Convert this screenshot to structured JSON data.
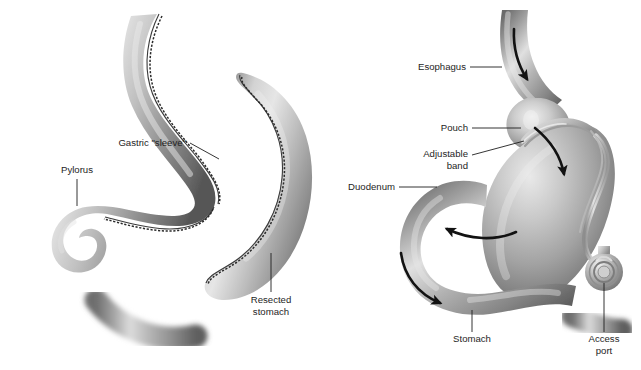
{
  "figure": {
    "background_color": "#ffffff",
    "label_color": "#1e1e1e",
    "tissue_light": "#e3e3e3",
    "tissue_mid": "#9d9d9d",
    "tissue_dark": "#5a5a5a",
    "staple_color": "#2b2b2b",
    "arrow_color": "#121212",
    "panels": [
      {
        "id": "left-panel",
        "name": "sleeve-gastrectomy-panel",
        "procedure": "Sleeve gastrectomy",
        "labels": [
          {
            "key": "gastric_sleeve",
            "text": "Gastric \"sleeve\"",
            "lines": [
              "Gastric \"sleeve\""
            ],
            "anchor": "end",
            "text_x": 186,
            "text_y": 143,
            "leader": "M190,143 L219,159"
          },
          {
            "key": "pylorus",
            "text": "Pylorus",
            "lines": [
              "Pylorus"
            ],
            "anchor": "middle",
            "text_x": 77,
            "text_y": 173,
            "leader": "M77,179 L77,206"
          },
          {
            "key": "resected_stomach",
            "text": "Resected stomach",
            "lines": [
              "Resected",
              "stomach"
            ],
            "anchor": "middle",
            "text_x": 271,
            "text_y": 303,
            "leader": "M271,253 L271,292"
          }
        ]
      },
      {
        "id": "right-panel",
        "name": "adjustable-gastric-band-panel",
        "procedure": "Adjustable gastric banding",
        "labels": [
          {
            "key": "esophagus",
            "text": "Esophagus",
            "lines": [
              "Esophagus"
            ],
            "anchor": "end",
            "text_x": 466,
            "text_y": 70,
            "leader": "M470,67 L502,67"
          },
          {
            "key": "pouch",
            "text": "Pouch",
            "lines": [
              "Pouch"
            ],
            "anchor": "end",
            "text_x": 468,
            "text_y": 131,
            "leader": "M472,128 L521,128"
          },
          {
            "key": "adjustable_band",
            "text": "Adjustable band",
            "lines": [
              "Adjustable",
              "band"
            ],
            "anchor": "end",
            "text_x": 468,
            "text_y": 157,
            "leader": "M472,155 L524,141"
          },
          {
            "key": "duodenum",
            "text": "Duodenum",
            "lines": [
              "Duodenum"
            ],
            "anchor": "end",
            "text_x": 395,
            "text_y": 190,
            "leader": "M399,187 L437,187"
          },
          {
            "key": "stomach",
            "text": "Stomach",
            "lines": [
              "Stomach"
            ],
            "anchor": "middle",
            "text_x": 472,
            "text_y": 342,
            "leader": "M472,310 L472,332"
          },
          {
            "key": "access_port",
            "text": "Access port",
            "lines": [
              "Access",
              "port"
            ],
            "anchor": "middle",
            "text_x": 604,
            "text_y": 342,
            "leader": "M604,283 L604,332"
          }
        ],
        "flow_arrows": [
          {
            "key": "esophageal-flow",
            "desc": "downward flow in esophagus"
          },
          {
            "key": "pouch-to-stomach-flow",
            "desc": "curved flow from pouch into stomach"
          },
          {
            "key": "antral-flow",
            "desc": "flow along greater curvature toward pylorus"
          },
          {
            "key": "duodenal-flow",
            "desc": "flow through duodenum"
          }
        ]
      }
    ]
  }
}
